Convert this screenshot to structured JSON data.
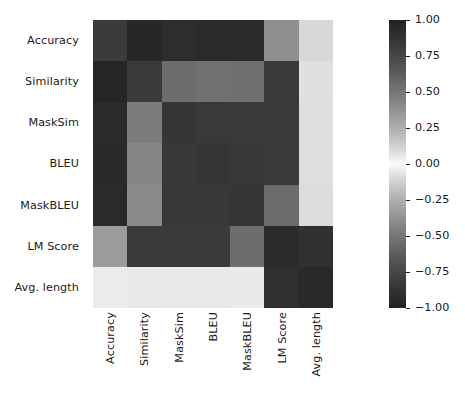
{
  "chart_data": {
    "type": "heatmap",
    "title": "",
    "xlabel": "",
    "ylabel": "",
    "grid": false,
    "legend_position": "right",
    "colorbar": {
      "label": "",
      "ticks": [
        "1.00",
        "0.75",
        "0.50",
        "0.25",
        "0.00",
        "-0.25",
        "-0.50",
        "-0.75",
        "-1.00"
      ],
      "tick_values": [
        1.0,
        0.75,
        0.5,
        0.25,
        0.0,
        -0.25,
        -0.5,
        -0.75,
        -1.0
      ],
      "vmin": -1.0,
      "vmax": 1.0,
      "colormap": "diverging-gray",
      "dark_at": "both extremes",
      "light_at": "zero"
    },
    "categories": [
      "Accuracy",
      "Similarity",
      "MaskSim",
      "BLEU",
      "MaskBLEU",
      "LM Score",
      "Avg. length"
    ],
    "x_tick_labels": [
      "Accuracy",
      "Similarity",
      "MaskSim",
      "BLEU",
      "MaskBLEU",
      "LM Score",
      "Avg. length"
    ],
    "y_tick_labels": [
      "Accuracy",
      "Similarity",
      "MaskSim",
      "BLEU",
      "MaskBLEU",
      "LM Score",
      "Avg. length"
    ],
    "x_tick_rotation": 90,
    "rows": [
      {
        "name": "Accuracy",
        "values": [
          1.0,
          0.96,
          0.92,
          0.94,
          0.93,
          0.55,
          0.18
        ]
      },
      {
        "name": "Similarity",
        "values": [
          0.96,
          1.0,
          0.72,
          0.7,
          0.71,
          0.86,
          0.15
        ]
      },
      {
        "name": "MaskSim",
        "values": [
          0.92,
          0.62,
          1.0,
          0.9,
          0.9,
          0.88,
          0.16
        ]
      },
      {
        "name": "BLEU",
        "values": [
          0.94,
          0.56,
          0.9,
          1.0,
          0.91,
          0.88,
          0.16
        ]
      },
      {
        "name": "MaskBLEU",
        "values": [
          0.93,
          0.55,
          0.9,
          0.91,
          1.0,
          0.7,
          0.17
        ]
      },
      {
        "name": "LM Score",
        "values": [
          0.48,
          0.86,
          0.88,
          0.88,
          0.7,
          1.0,
          0.93
        ]
      },
      {
        "name": "Avg. length",
        "values": [
          0.06,
          0.07,
          0.08,
          0.08,
          0.07,
          0.93,
          0.96
        ]
      }
    ],
    "cell_colors": [
      [
        "#3b3b3b",
        "#272727",
        "#2d2d2d",
        "#2a2a2a",
        "#2b2b2b",
        "#8f8f8f",
        "#d8d8d8"
      ],
      [
        "#262626",
        "#3a3a3a",
        "#6d6d6d",
        "#717171",
        "#6f6f6f",
        "#3a3a3a",
        "#e0e0e0"
      ],
      [
        "#2b2b2b",
        "#7c7c7c",
        "#363636",
        "#393939",
        "#393939",
        "#3a3a3a",
        "#dedede"
      ],
      [
        "#292929",
        "#868686",
        "#383838",
        "#353535",
        "#383838",
        "#3a3a3a",
        "#dedede"
      ],
      [
        "#2a2a2a",
        "#8a8a8a",
        "#383838",
        "#383838",
        "#353535",
        "#6c6c6c",
        "#dcdcdc"
      ],
      [
        "#9c9c9c",
        "#3b3b3b",
        "#3a3a3a",
        "#3a3a3a",
        "#6d6d6d",
        "#2b2b2b",
        "#313131"
      ],
      [
        "#ebebeb",
        "#e9e9e9",
        "#e8e8e8",
        "#e8e8e8",
        "#eaeaea",
        "#2f2f2f",
        "#292929"
      ]
    ]
  }
}
